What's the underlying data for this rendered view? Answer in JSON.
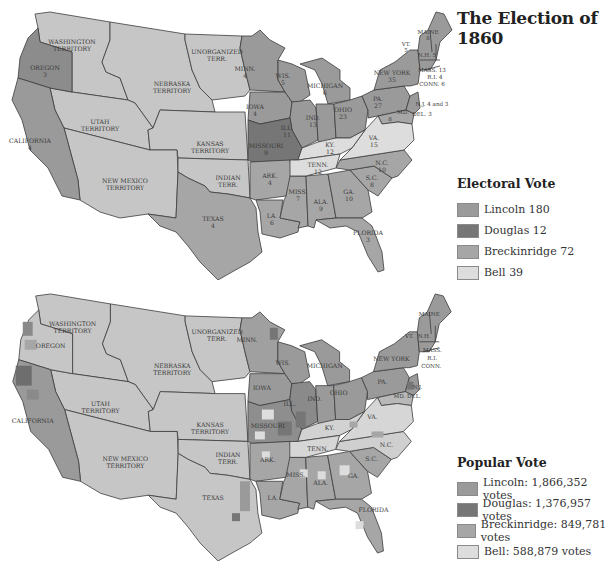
{
  "title": "The Election of 1860",
  "colors": {
    "lincoln": "#9a9a9a",
    "douglas": "#767676",
    "breckinridge": "#a6a6a6",
    "bell": "#dddddd",
    "territory": "#c6c6c6",
    "border": "#3c3c3c"
  },
  "electoral_legend": {
    "title": "Electoral Vote",
    "items": [
      {
        "label": "Lincoln 180",
        "color": "#9a9a9a"
      },
      {
        "label": "Douglas 12",
        "color": "#767676"
      },
      {
        "label": "Breckinridge 72",
        "color": "#a6a6a6"
      },
      {
        "label": "Bell 39",
        "color": "#dddddd"
      }
    ]
  },
  "popular_legend": {
    "title": "Popular Vote",
    "items": [
      {
        "label": "Lincoln: 1,866,352 votes",
        "color": "#9a9a9a"
      },
      {
        "label": "Douglas: 1,376,957 votes",
        "color": "#767676"
      },
      {
        "label": "Breckinridge: 849,781 votes",
        "color": "#a6a6a6"
      },
      {
        "label": "Bell: 588,879 votes",
        "color": "#dddddd"
      }
    ]
  },
  "electoral_map": {
    "labels": {
      "washington": [
        "WASHINGTON",
        "TERRITORY"
      ],
      "oregon": [
        "OREGON",
        "3"
      ],
      "california": [
        "CALIFORNIA",
        "4"
      ],
      "utah": [
        "UTAH",
        "TERRITORY"
      ],
      "nebraska": [
        "NEBRASKA",
        "TERRITORY"
      ],
      "unorganized": [
        "UNORGANIZED",
        "TERR."
      ],
      "kansas": [
        "KANSAS",
        "TERRITORY"
      ],
      "new_mexico": [
        "NEW MEXICO",
        "TERRITORY"
      ],
      "indian": [
        "INDIAN",
        "TERR."
      ],
      "texas": [
        "TEXAS",
        "4"
      ],
      "minn": [
        "MINN.",
        "4"
      ],
      "iowa": [
        "IOWA",
        "4"
      ],
      "wis": [
        "WIS.",
        "5"
      ],
      "michigan": [
        "MICHIGAN",
        "6"
      ],
      "ill": [
        "ILL.",
        "11"
      ],
      "ind": [
        "IND.",
        "13"
      ],
      "ohio": [
        "OHIO",
        "23"
      ],
      "missouri": [
        "MISSOURI",
        "9"
      ],
      "ark": [
        "ARK.",
        "4"
      ],
      "la": [
        "LA.",
        "6"
      ],
      "miss": [
        "MISS.",
        "7"
      ],
      "ala": [
        "ALA.",
        "9"
      ],
      "ga": [
        "GA.",
        "10"
      ],
      "sc": [
        "S.C.",
        "8"
      ],
      "nc": [
        "N.C.",
        "10"
      ],
      "tenn": [
        "TENN.",
        "12"
      ],
      "ky": [
        "KY.",
        "12"
      ],
      "va": [
        "VA.",
        "15"
      ],
      "florida": [
        "FLORIDA",
        "3"
      ],
      "pa": [
        "PA.",
        "27"
      ],
      "new_york": [
        "NEW YORK",
        "35"
      ],
      "vt": [
        "VT.",
        "5"
      ],
      "nh": "N.H. 5",
      "maine": [
        "MAINE",
        "8"
      ],
      "mass": "MASS. 13",
      "ri": "R.I. 4",
      "conn": "CONN. 6",
      "nj": "N.J. 4 and 3",
      "md": "MD.",
      "del": "DEL. 3",
      "md_num": "8"
    }
  },
  "popular_map": {
    "labels": {
      "washington": [
        "WASHINGTON",
        "TERRITORY"
      ],
      "oregon": "OREGON",
      "california": "CALIFORNIA",
      "utah": [
        "UTAH",
        "TERRITORY"
      ],
      "nebraska": [
        "NEBRASKA",
        "TERRITORY"
      ],
      "unorganized": [
        "UNORGANIZED",
        "TERR."
      ],
      "kansas": [
        "KANSAS",
        "TERRITORY"
      ],
      "new_mexico": [
        "NEW MEXICO",
        "TERRITORY"
      ],
      "indian": [
        "INDIAN",
        "TERR."
      ],
      "texas": "TEXAS",
      "minn": "MINN.",
      "iowa": "IOWA",
      "wis": "WIS.",
      "michigan": "MICHIGAN",
      "ill": "ILL.",
      "ind": "IND.",
      "ohio": "OHIO",
      "missouri": "MISSOURI",
      "ark": "ARK.",
      "la": "LA.",
      "miss": "MISS.",
      "ala": "ALA.",
      "ga": "GA.",
      "sc": "S.C.",
      "nc": "N.C.",
      "tenn": "TENN.",
      "ky": "KY.",
      "va": "VA.",
      "florida": "FLORIDA",
      "pa": "PA.",
      "new_york": "NEW YORK",
      "vt": "VT.",
      "nh": "N.H.",
      "maine": "MAINE",
      "mass": "MASS.",
      "ri": "R.I.",
      "conn": "CONN.",
      "nj": "N.J.",
      "md_del": "MD. DEL."
    }
  }
}
